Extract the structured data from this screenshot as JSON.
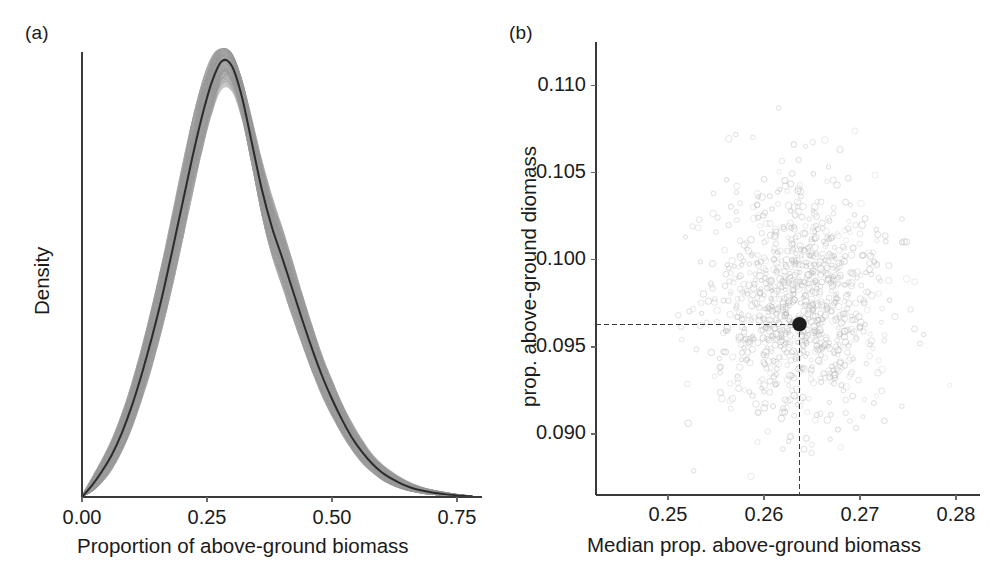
{
  "figure": {
    "background": "#ffffff",
    "width": 999,
    "height": 581,
    "panels": [
      {
        "label": "(a)"
      },
      {
        "label": "(b)"
      }
    ]
  },
  "colors": {
    "ribbon_gray": "#c6c6c6",
    "median_black": "#2b2b2b",
    "scatter_gray": "#b9b9b9",
    "point_black": "#1c1c1c",
    "axis_gray": "#3a3a3a",
    "text_black": "#1b1b1b"
  },
  "chart_data": [
    {
      "type": "area",
      "panel": "(a)",
      "title": "",
      "xlabel": "Proportion of above-ground biomass",
      "ylabel": "Density",
      "xlim": [
        0.0,
        0.78
      ],
      "ylim": [
        0.0,
        3.45
      ],
      "grid": false,
      "legend": "none",
      "xticks": [
        0.0,
        0.25,
        0.5,
        0.75
      ],
      "xticklabels": [
        "0.00",
        "0.25",
        "0.50",
        "0.75"
      ],
      "yticks": [],
      "yticklabels": [],
      "annotations": [
        "gray band = posterior density draws",
        "black line = median density"
      ],
      "x": [
        0.0,
        0.02,
        0.04,
        0.06,
        0.08,
        0.1,
        0.12,
        0.14,
        0.16,
        0.18,
        0.2,
        0.22,
        0.24,
        0.26,
        0.28,
        0.3,
        0.32,
        0.34,
        0.36,
        0.38,
        0.4,
        0.42,
        0.44,
        0.46,
        0.48,
        0.5,
        0.52,
        0.54,
        0.56,
        0.58,
        0.6,
        0.62,
        0.64,
        0.66,
        0.68,
        0.7,
        0.72,
        0.75,
        0.78
      ],
      "series": [
        {
          "name": "median density",
          "values": [
            0.0,
            0.09,
            0.2,
            0.33,
            0.5,
            0.71,
            0.96,
            1.24,
            1.55,
            1.9,
            2.26,
            2.62,
            2.95,
            3.22,
            3.38,
            3.34,
            3.1,
            2.74,
            2.38,
            2.09,
            1.86,
            1.62,
            1.38,
            1.15,
            0.94,
            0.76,
            0.6,
            0.46,
            0.35,
            0.26,
            0.19,
            0.14,
            0.1,
            0.07,
            0.05,
            0.035,
            0.025,
            0.012,
            0.005
          ]
        },
        {
          "name": "upper envelope",
          "values": [
            0.02,
            0.16,
            0.3,
            0.46,
            0.66,
            0.9,
            1.18,
            1.49,
            1.83,
            2.2,
            2.57,
            2.92,
            3.22,
            3.42,
            3.48,
            3.44,
            3.24,
            2.94,
            2.62,
            2.34,
            2.1,
            1.85,
            1.59,
            1.34,
            1.11,
            0.91,
            0.73,
            0.58,
            0.45,
            0.34,
            0.26,
            0.2,
            0.15,
            0.11,
            0.08,
            0.06,
            0.045,
            0.025,
            0.012
          ]
        },
        {
          "name": "lower envelope",
          "values": [
            0.0,
            0.04,
            0.11,
            0.21,
            0.35,
            0.53,
            0.75,
            1.0,
            1.29,
            1.61,
            1.96,
            2.32,
            2.67,
            2.97,
            3.16,
            3.14,
            2.92,
            2.56,
            2.17,
            1.86,
            1.63,
            1.4,
            1.18,
            0.97,
            0.78,
            0.62,
            0.48,
            0.36,
            0.26,
            0.19,
            0.13,
            0.09,
            0.06,
            0.04,
            0.025,
            0.015,
            0.01,
            0.004,
            0.001
          ]
        }
      ]
    },
    {
      "type": "scatter",
      "panel": "(b)",
      "title": "",
      "xlabel": "Median prop. above-ground biomass",
      "ylabel": "prop. above-ground diomass",
      "xlim": [
        0.2425,
        0.2825
      ],
      "ylim": [
        0.0865,
        0.1125
      ],
      "grid": false,
      "legend": "none",
      "xticks": [
        0.25,
        0.26,
        0.27,
        0.28
      ],
      "xticklabels": [
        "0.25",
        "0.26",
        "0.27",
        "0.28"
      ],
      "yticks": [
        0.09,
        0.095,
        0.1,
        0.105,
        0.11
      ],
      "yticklabels": [
        "0.090",
        "0.095",
        "0.100",
        "0.105",
        "0.110"
      ],
      "n_points": 1000,
      "cloud_center": [
        0.2637,
        0.0975
      ],
      "cloud_sd": [
        0.0045,
        0.0034
      ],
      "highlight_point": {
        "x": 0.2637,
        "y": 0.0963,
        "label": "observed estimate"
      },
      "annotations": [
        "dashed crosshair marks the observed estimate"
      ]
    }
  ]
}
